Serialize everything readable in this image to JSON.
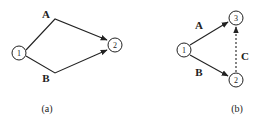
{
  "diagram_a": {
    "caption": "(a)",
    "nodes": [
      {
        "id": "1",
        "label": "1"
      },
      {
        "id": "2",
        "label": "2"
      }
    ],
    "edges": [
      {
        "label": "A",
        "from": "1",
        "to": "2",
        "style": "solid"
      },
      {
        "label": "B",
        "from": "1",
        "to": "2",
        "style": "solid"
      }
    ]
  },
  "diagram_b": {
    "caption": "(b)",
    "nodes": [
      {
        "id": "1",
        "label": "1"
      },
      {
        "id": "2",
        "label": "2"
      },
      {
        "id": "3",
        "label": "3"
      }
    ],
    "edges": [
      {
        "label": "A",
        "from": "1",
        "to": "3",
        "style": "solid"
      },
      {
        "label": "B",
        "from": "1",
        "to": "2",
        "style": "solid"
      },
      {
        "label": "C",
        "from": "2",
        "to": "3",
        "style": "dashed"
      }
    ]
  },
  "colors": {
    "stroke": "#222222",
    "background": "#ffffff"
  }
}
